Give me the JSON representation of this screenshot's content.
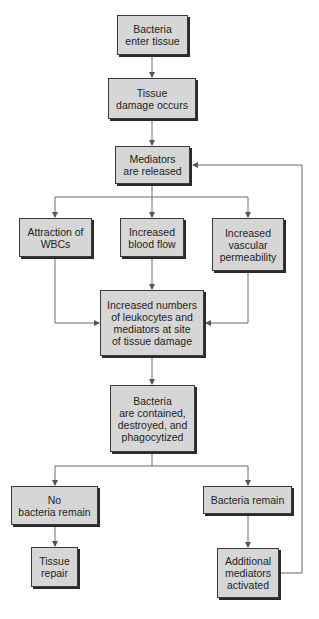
{
  "diagram": {
    "type": "flowchart",
    "colors": {
      "box_fill": "#d6d6d6",
      "box_border": "#3a3a3a",
      "connector": "#6b6b6b",
      "text": "#1e1e1e"
    },
    "nodes": {
      "bacteria_enter": "Bacteria\nenter tissue",
      "tissue_damage": "Tissue\ndamage occurs",
      "mediators_released": "Mediators\nare released",
      "attraction_wbcs": "Attraction of\nWBCs",
      "increased_blood_flow": "Increased\nblood flow",
      "increased_vascular_permeability": "Increased\nvascular\npermeability",
      "increased_numbers": "Increased numbers\nof leukocytes and\nmediators at site\nof tissue damage",
      "bacteria_contained": "Bacteria\nare contained,\ndestroyed, and\nphagocytized",
      "no_bacteria_remain": "No\nbacteria remain",
      "tissue_repair": "Tissue\nrepair",
      "bacteria_remain": "Bacteria remain",
      "additional_mediators": "Additional\nmediators\nactivated"
    },
    "edges": [
      [
        "bacteria_enter",
        "tissue_damage"
      ],
      [
        "tissue_damage",
        "mediators_released"
      ],
      [
        "mediators_released",
        "attraction_wbcs"
      ],
      [
        "mediators_released",
        "increased_blood_flow"
      ],
      [
        "mediators_released",
        "increased_vascular_permeability"
      ],
      [
        "attraction_wbcs",
        "increased_numbers"
      ],
      [
        "increased_blood_flow",
        "increased_numbers"
      ],
      [
        "increased_vascular_permeability",
        "increased_numbers"
      ],
      [
        "increased_numbers",
        "bacteria_contained"
      ],
      [
        "bacteria_contained",
        "no_bacteria_remain"
      ],
      [
        "bacteria_contained",
        "bacteria_remain"
      ],
      [
        "no_bacteria_remain",
        "tissue_repair"
      ],
      [
        "bacteria_remain",
        "additional_mediators"
      ],
      [
        "additional_mediators",
        "mediators_released"
      ]
    ]
  }
}
